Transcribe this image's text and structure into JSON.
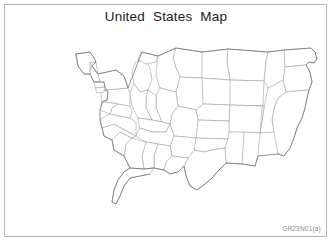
{
  "page": {
    "title": "United States Map",
    "item_code": "GR23N01(a)",
    "background_color": "#ffffff",
    "frame_color": "#b9b9b9",
    "title_color": "#1b1b1b",
    "item_code_color": "#8d8d8d"
  },
  "map": {
    "name": "contiguous-united-states",
    "projection_note": "standard orientation, west coast at right, east coast at left",
    "state_border_color": "#9a9a9a",
    "national_outline_color": "#6f6f6f",
    "fill_color": "#ffffff",
    "labels_visible": false,
    "regions_visible": [
      "West Coast",
      "Mountain West",
      "Great Plains",
      "Midwest",
      "Great Lakes",
      "Northeast",
      "Mid-Atlantic",
      "Southeast",
      "Gulf Coast",
      "Florida Peninsula",
      "Texas"
    ]
  }
}
